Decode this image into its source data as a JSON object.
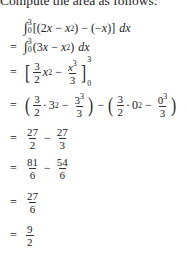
{
  "intro": "Compute the area as follows:",
  "lines": [
    {
      "prefix": "",
      "text": "∫₀³[(2x − x²) − (−x)] dx"
    },
    {
      "prefix": "=",
      "text": "∫₀³(3x − x²) dx"
    },
    {
      "prefix": "=",
      "text": "[ (3/2)x² − x³/3 ]₀³"
    },
    {
      "prefix": "=",
      "text": "(3/2 · 3² − 3³/3) − (3/2 · 0² − 0³/3)"
    },
    {
      "prefix": "=",
      "text": "27/2 − 27/3"
    },
    {
      "prefix": "=",
      "text": "81/6 − 54/6"
    },
    {
      "prefix": "=",
      "text": "27/6"
    },
    {
      "prefix": "=",
      "text": "9/2"
    }
  ],
  "tokens": {
    "eq": "=",
    "minus": "−",
    "dot": "·",
    "x": "x",
    "dx": "dx",
    "int": "∫",
    "lo0": "0",
    "hi3": "3",
    "sq": "2",
    "cube": "3",
    "lparen": "(",
    "rparen": ")",
    "lbrack": "[",
    "rbrack": "]",
    "two": "2",
    "three": "3",
    "zero": "0",
    "n3": "3",
    "n27": "27",
    "n81": "81",
    "n54": "54",
    "n6": "6",
    "n9": "9",
    "l1_inner": "[(2",
    "l1_mid": " − ",
    "l1_end": ") − (−",
    "l1_close": ")]",
    "l2_open": "(3",
    "l2_mid": " − ",
    "l2_close": ")"
  }
}
